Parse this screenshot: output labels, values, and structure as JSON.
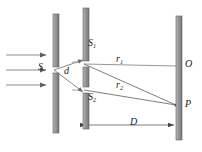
{
  "figure": {
    "width": 202,
    "height": 152,
    "background": "#ffffff"
  },
  "colors": {
    "barrier_fill": "#9a9a9a",
    "barrier_light": "#c9c9c9",
    "barrier_dark": "#6e6e6e",
    "barrier_outline": "#555555",
    "ray_line": "#8a8a8a",
    "incident_arrow": "#6b6b6b",
    "label_text": "#1a1a1a",
    "dimension_line": "#8a8a8a"
  },
  "labels": {
    "source_slit": "S",
    "slit_top": "S",
    "slit_top_sub": "1",
    "slit_bottom": "S",
    "slit_bottom_sub": "2",
    "slit_separation": "d",
    "ray_top": "r",
    "ray_top_sub": "1",
    "ray_bottom": "r",
    "ray_bottom_sub": "2",
    "screen_center": "O",
    "screen_point": "P",
    "screen_distance": "D"
  },
  "geometry": {
    "barrier_source": {
      "x": 53,
      "y_top": 14,
      "y_bottom": 133,
      "width": 6,
      "slit_y": 70
    },
    "barrier_double": {
      "x": 83,
      "y_top": 8,
      "y_bottom": 129,
      "width": 6,
      "slit_top_y": 64,
      "slit_bottom_y": 90
    },
    "screen": {
      "x": 176,
      "y_top": 16,
      "y_bottom": 140,
      "width": 6
    },
    "point_O": {
      "x": 176,
      "y": 66
    },
    "point_P": {
      "x": 176,
      "y": 105
    },
    "incident_arrows_y": [
      55,
      70,
      85
    ],
    "dimension_D_y": 125
  },
  "icons": {
    "incident_wave": "rightward-arrow",
    "dimension": "double-headed-arrow"
  }
}
